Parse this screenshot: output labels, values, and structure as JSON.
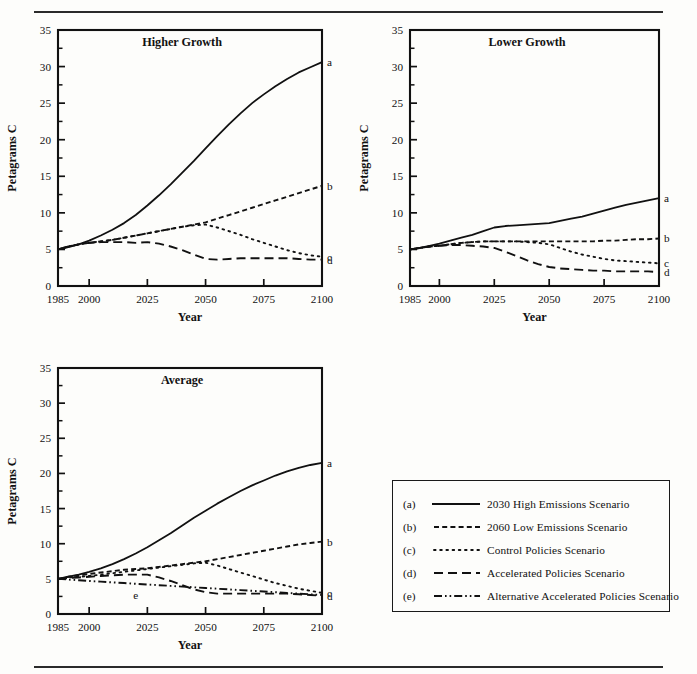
{
  "figure": {
    "y_axis_label": "Petagrams C",
    "x_axis_label": "Year",
    "y_ticks": [
      0,
      5,
      10,
      15,
      20,
      25,
      30,
      35
    ],
    "y_minor_step": 2.5,
    "ylim": [
      0,
      35
    ],
    "x_ticks": [
      1985,
      2000,
      2025,
      2050,
      2075,
      2100
    ],
    "xlim": [
      1985,
      2100
    ],
    "end_labels": [
      "a",
      "b",
      "c",
      "d"
    ],
    "inline_label_e": "e"
  },
  "legend": {
    "rows": [
      {
        "key": "(a)",
        "style": "solid",
        "label": "2030 High Emissions Scenario"
      },
      {
        "key": "(b)",
        "style": "dashed-short",
        "label": "2060 Low Emissions Scenario"
      },
      {
        "key": "(c)",
        "style": "dotted",
        "label": "Control Policies Scenario"
      },
      {
        "key": "(d)",
        "style": "dashed-long",
        "label": "Accelerated Policies Scenario"
      },
      {
        "key": "(e)",
        "style": "dash-dot-dot",
        "label": "Alternative Accelerated Policies Scenario"
      }
    ]
  },
  "chart_data": [
    {
      "id": "higher",
      "type": "line",
      "title": "Higher Growth",
      "xlabel": "Year",
      "ylabel": "Petagrams C",
      "xlim": [
        1985,
        2100
      ],
      "ylim": [
        0,
        35
      ],
      "xticks": [
        1985,
        2000,
        2025,
        2050,
        2075,
        2100
      ],
      "yticks": [
        0,
        5,
        10,
        15,
        20,
        25,
        30,
        35
      ],
      "grid": false,
      "legend_position": "right-edge-letters",
      "x": [
        1985,
        1990,
        1995,
        2000,
        2005,
        2010,
        2015,
        2020,
        2025,
        2030,
        2035,
        2040,
        2045,
        2050,
        2055,
        2060,
        2065,
        2070,
        2075,
        2080,
        2085,
        2090,
        2095,
        2100
      ],
      "series": [
        {
          "name": "a",
          "label": "2030 High Emissions Scenario",
          "style": "solid",
          "values": [
            5.0,
            5.3,
            5.7,
            6.2,
            6.9,
            7.7,
            8.6,
            9.7,
            11.0,
            12.4,
            13.9,
            15.5,
            17.1,
            18.8,
            20.5,
            22.1,
            23.6,
            25.0,
            26.2,
            27.3,
            28.3,
            29.2,
            29.9,
            30.6
          ]
        },
        {
          "name": "b",
          "label": "2060 Low Emissions Scenario",
          "style": "dashed-short",
          "values": [
            5.0,
            5.4,
            5.7,
            5.9,
            6.1,
            6.3,
            6.6,
            6.9,
            7.2,
            7.5,
            7.8,
            8.1,
            8.4,
            8.7,
            9.2,
            9.7,
            10.2,
            10.7,
            11.2,
            11.7,
            12.2,
            12.7,
            13.2,
            13.7
          ]
        },
        {
          "name": "c",
          "label": "Control Policies Scenario",
          "style": "dotted",
          "values": [
            5.0,
            5.4,
            5.7,
            5.9,
            6.1,
            6.3,
            6.6,
            6.9,
            7.2,
            7.5,
            7.8,
            8.1,
            8.3,
            8.4,
            8.0,
            7.5,
            7.0,
            6.4,
            5.9,
            5.4,
            4.9,
            4.5,
            4.2,
            4.0
          ]
        },
        {
          "name": "d",
          "label": "Accelerated Policies Scenario",
          "style": "dashed-long",
          "values": [
            5.0,
            5.4,
            5.7,
            5.9,
            6.0,
            6.0,
            6.0,
            5.9,
            6.0,
            5.8,
            5.4,
            4.9,
            4.3,
            3.7,
            3.6,
            3.7,
            3.8,
            3.8,
            3.8,
            3.8,
            3.8,
            3.7,
            3.6,
            3.6
          ]
        }
      ]
    },
    {
      "id": "lower",
      "type": "line",
      "title": "Lower Growth",
      "xlabel": "Year",
      "ylabel": "Petagrams C",
      "xlim": [
        1985,
        2100
      ],
      "ylim": [
        0,
        35
      ],
      "xticks": [
        1985,
        2000,
        2025,
        2050,
        2075,
        2100
      ],
      "yticks": [
        0,
        5,
        10,
        15,
        20,
        25,
        30,
        35
      ],
      "grid": false,
      "legend_position": "right-edge-letters",
      "x": [
        1985,
        1990,
        1995,
        2000,
        2005,
        2010,
        2015,
        2020,
        2025,
        2030,
        2035,
        2040,
        2045,
        2050,
        2055,
        2060,
        2065,
        2070,
        2075,
        2080,
        2085,
        2090,
        2095,
        2100
      ],
      "series": [
        {
          "name": "a",
          "label": "2030 High Emissions Scenario",
          "style": "solid",
          "values": [
            5.0,
            5.2,
            5.5,
            5.8,
            6.2,
            6.6,
            7.0,
            7.5,
            8.0,
            8.2,
            8.3,
            8.4,
            8.5,
            8.6,
            8.9,
            9.2,
            9.5,
            9.9,
            10.3,
            10.7,
            11.1,
            11.4,
            11.7,
            12.0
          ]
        },
        {
          "name": "b",
          "label": "2060 Low Emissions Scenario",
          "style": "dashed-short",
          "values": [
            5.0,
            5.2,
            5.4,
            5.5,
            5.7,
            5.9,
            6.0,
            6.1,
            6.1,
            6.1,
            6.1,
            6.1,
            6.1,
            6.1,
            6.1,
            6.1,
            6.1,
            6.1,
            6.2,
            6.2,
            6.3,
            6.4,
            6.4,
            6.5
          ]
        },
        {
          "name": "c",
          "label": "Control Policies Scenario",
          "style": "dotted",
          "values": [
            5.0,
            5.2,
            5.4,
            5.5,
            5.7,
            5.9,
            6.0,
            6.1,
            6.1,
            6.1,
            6.1,
            6.0,
            5.9,
            5.7,
            5.2,
            4.7,
            4.3,
            4.0,
            3.7,
            3.5,
            3.4,
            3.3,
            3.2,
            3.1
          ]
        },
        {
          "name": "d",
          "label": "Accelerated Policies Scenario",
          "style": "dashed-long",
          "values": [
            5.0,
            5.2,
            5.4,
            5.5,
            5.6,
            5.6,
            5.5,
            5.4,
            5.2,
            4.7,
            4.1,
            3.5,
            3.0,
            2.6,
            2.4,
            2.3,
            2.2,
            2.1,
            2.1,
            2.0,
            2.0,
            2.0,
            2.0,
            1.9
          ]
        }
      ]
    },
    {
      "id": "average",
      "type": "line",
      "title": "Average",
      "xlabel": "Year",
      "ylabel": "Petagrams C",
      "xlim": [
        1985,
        2100
      ],
      "ylim": [
        0,
        35
      ],
      "xticks": [
        1985,
        2000,
        2025,
        2050,
        2075,
        2100
      ],
      "yticks": [
        0,
        5,
        10,
        15,
        20,
        25,
        30,
        35
      ],
      "grid": false,
      "legend_position": "right-edge-letters",
      "x": [
        1985,
        1990,
        1995,
        2000,
        2005,
        2010,
        2015,
        2020,
        2025,
        2030,
        2035,
        2040,
        2045,
        2050,
        2055,
        2060,
        2065,
        2070,
        2075,
        2080,
        2085,
        2090,
        2095,
        2100
      ],
      "series": [
        {
          "name": "a",
          "label": "2030 High Emissions Scenario",
          "style": "solid",
          "values": [
            5.0,
            5.3,
            5.6,
            6.0,
            6.5,
            7.1,
            7.8,
            8.6,
            9.5,
            10.5,
            11.5,
            12.6,
            13.7,
            14.7,
            15.7,
            16.6,
            17.5,
            18.3,
            19.0,
            19.7,
            20.3,
            20.8,
            21.2,
            21.5
          ]
        },
        {
          "name": "b",
          "label": "2060 Low Emissions Scenario",
          "style": "dashed-short",
          "values": [
            5.0,
            5.3,
            5.5,
            5.7,
            5.9,
            6.1,
            6.3,
            6.4,
            6.5,
            6.7,
            6.9,
            7.1,
            7.3,
            7.5,
            7.8,
            8.1,
            8.4,
            8.7,
            9.0,
            9.3,
            9.6,
            9.9,
            10.1,
            10.3
          ]
        },
        {
          "name": "c",
          "label": "Control Policies Scenario",
          "style": "dotted",
          "values": [
            5.0,
            5.2,
            5.3,
            5.4,
            5.6,
            5.8,
            6.0,
            6.2,
            6.4,
            6.6,
            6.8,
            7.0,
            7.2,
            7.3,
            6.9,
            6.4,
            5.9,
            5.4,
            4.9,
            4.4,
            4.0,
            3.6,
            3.3,
            3.0
          ]
        },
        {
          "name": "d",
          "label": "Accelerated Policies Scenario",
          "style": "dashed-long",
          "values": [
            5.0,
            5.1,
            5.2,
            5.3,
            5.4,
            5.5,
            5.6,
            5.6,
            5.6,
            5.2,
            4.7,
            4.1,
            3.5,
            3.1,
            2.9,
            2.9,
            2.9,
            2.9,
            2.9,
            2.9,
            2.9,
            2.8,
            2.7,
            2.6
          ]
        },
        {
          "name": "e",
          "label": "Alternative Accelerated Policies Scenario",
          "style": "dash-dot-dot",
          "values": [
            5.0,
            4.9,
            4.8,
            4.7,
            4.6,
            4.5,
            4.4,
            4.3,
            4.2,
            4.1,
            4.0,
            3.9,
            3.8,
            3.7,
            3.6,
            3.5,
            3.4,
            3.3,
            3.2,
            3.1,
            3.0,
            2.9,
            2.8,
            2.7
          ]
        }
      ]
    }
  ]
}
